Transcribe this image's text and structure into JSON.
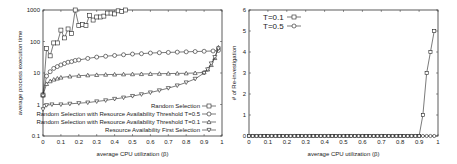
{
  "chart_data": [
    {
      "type": "line",
      "title": "",
      "xlabel": "average CPU utilization (β)",
      "ylabel": "average process execution time",
      "xlim": [
        0,
        1
      ],
      "ylim": [
        0.1,
        1000
      ],
      "yscale": "log",
      "grid": false,
      "legend_position": "lower right",
      "x_ticks": [
        "0",
        "0.1",
        "0.2",
        "0.3",
        "0.4",
        "0.5",
        "0.6",
        "0.7",
        "0.8",
        "0.9",
        "1"
      ],
      "y_ticks": [
        "0.1",
        "1",
        "10",
        "100",
        "1000"
      ],
      "series": [
        {
          "name": "Random Selection",
          "marker": "square",
          "x": [
            0,
            0.02,
            0.04,
            0.06,
            0.08,
            0.1,
            0.12,
            0.14,
            0.16,
            0.18,
            0.2,
            0.22,
            0.24,
            0.26,
            0.28,
            0.3,
            0.32,
            0.34,
            0.36,
            0.38,
            0.4,
            0.42,
            0.44,
            0.46
          ],
          "values": [
            2,
            60,
            35,
            90,
            90,
            230,
            130,
            250,
            180,
            1000,
            320,
            350,
            320,
            680,
            480,
            600,
            600,
            640,
            800,
            800,
            750,
            940,
            890,
            1000
          ]
        },
        {
          "name": "Random Selection with Resource Availability Threshold T=0.5",
          "marker": "circle",
          "x": [
            0,
            0.02,
            0.04,
            0.06,
            0.08,
            0.1,
            0.12,
            0.14,
            0.16,
            0.18,
            0.2,
            0.25,
            0.3,
            0.35,
            0.4,
            0.45,
            0.5,
            0.55,
            0.6,
            0.65,
            0.7,
            0.75,
            0.8,
            0.85,
            0.9,
            0.95,
            0.98
          ],
          "values": [
            2,
            8,
            11,
            14,
            16,
            18,
            20,
            22,
            23,
            25,
            26,
            29,
            32,
            34,
            36,
            38,
            40,
            41,
            43,
            44,
            45,
            46,
            47,
            48,
            49,
            50,
            52
          ]
        },
        {
          "name": "Random Selection with Resource Availability Threshold T=0.1",
          "marker": "triangle-up",
          "x": [
            0,
            0.02,
            0.04,
            0.06,
            0.08,
            0.1,
            0.15,
            0.2,
            0.25,
            0.3,
            0.35,
            0.4,
            0.45,
            0.5,
            0.55,
            0.6,
            0.65,
            0.7,
            0.75,
            0.8,
            0.85,
            0.9,
            0.92,
            0.94,
            0.96,
            0.98
          ],
          "values": [
            2,
            4.5,
            5.5,
            6.2,
            6.7,
            7.2,
            7.8,
            8.2,
            8.5,
            8.7,
            8.9,
            9,
            9.1,
            9.2,
            9.3,
            9.4,
            9.5,
            9.6,
            9.7,
            9.8,
            10,
            10.5,
            13,
            18,
            30,
            65
          ]
        },
        {
          "name": "Resource Availability First Selection",
          "marker": "triangle-down",
          "x": [
            0,
            0.02,
            0.05,
            0.1,
            0.15,
            0.2,
            0.25,
            0.3,
            0.35,
            0.4,
            0.45,
            0.5,
            0.55,
            0.6,
            0.65,
            0.7,
            0.75,
            0.8,
            0.85,
            0.9,
            0.92,
            0.94,
            0.96,
            0.98
          ],
          "values": [
            0.7,
            0.95,
            1.0,
            1.0,
            1.05,
            1.1,
            1.15,
            1.25,
            1.35,
            1.5,
            1.65,
            1.85,
            2.1,
            2.4,
            2.8,
            3.3,
            4,
            5,
            6.5,
            10,
            13,
            20,
            32,
            60
          ]
        }
      ]
    },
    {
      "type": "line",
      "title": "",
      "xlabel": "average CPU utilization (β)",
      "ylabel": "# of Re-investigation",
      "xlim": [
        0,
        1
      ],
      "ylim": [
        0,
        6
      ],
      "grid": false,
      "legend_position": "upper left",
      "x_ticks": [
        "0",
        "0.1",
        "0.2",
        "0.3",
        "0.4",
        "0.5",
        "0.6",
        "0.7",
        "0.8",
        "0.9",
        "1"
      ],
      "y_ticks": [
        "0",
        "1",
        "2",
        "3",
        "4",
        "5",
        "6"
      ],
      "series": [
        {
          "name": "T=0.1",
          "marker": "square",
          "x": [
            0,
            0.02,
            0.04,
            0.06,
            0.08,
            0.1,
            0.12,
            0.14,
            0.16,
            0.18,
            0.2,
            0.22,
            0.24,
            0.26,
            0.28,
            0.3,
            0.32,
            0.34,
            0.36,
            0.38,
            0.4,
            0.42,
            0.44,
            0.46,
            0.48,
            0.5,
            0.52,
            0.54,
            0.56,
            0.58,
            0.6,
            0.62,
            0.64,
            0.66,
            0.68,
            0.7,
            0.72,
            0.74,
            0.76,
            0.78,
            0.8,
            0.82,
            0.84,
            0.86,
            0.88,
            0.9,
            0.92,
            0.94,
            0.96,
            0.98
          ],
          "values": [
            0,
            0,
            0,
            0,
            0,
            0,
            0,
            0,
            0,
            0,
            0,
            0,
            0,
            0,
            0,
            0,
            0,
            0,
            0,
            0,
            0,
            0,
            0,
            0,
            0,
            0,
            0,
            0,
            0,
            0,
            0,
            0,
            0,
            0,
            0,
            0,
            0,
            0,
            0,
            0,
            0,
            0,
            0,
            0,
            0,
            0,
            1,
            3,
            4,
            5
          ]
        },
        {
          "name": "T=0.5",
          "marker": "circle",
          "x": [
            0,
            0.02,
            0.04,
            0.06,
            0.08,
            0.1,
            0.12,
            0.14,
            0.16,
            0.18,
            0.2,
            0.22,
            0.24,
            0.26,
            0.28,
            0.3,
            0.32,
            0.34,
            0.36,
            0.38,
            0.4,
            0.42,
            0.44,
            0.46,
            0.48,
            0.5,
            0.52,
            0.54,
            0.56,
            0.58,
            0.6,
            0.62,
            0.64,
            0.66,
            0.68,
            0.7,
            0.72,
            0.74,
            0.76,
            0.78,
            0.8,
            0.82,
            0.84,
            0.86,
            0.88,
            0.9,
            0.92,
            0.94,
            0.96,
            0.98
          ],
          "values": [
            0,
            0,
            0,
            0,
            0,
            0,
            0,
            0,
            0,
            0,
            0,
            0,
            0,
            0,
            0,
            0,
            0,
            0,
            0,
            0,
            0,
            0,
            0,
            0,
            0,
            0,
            0,
            0,
            0,
            0,
            0,
            0,
            0,
            0,
            0,
            0,
            0,
            0,
            0,
            0,
            0,
            0,
            0,
            0,
            0,
            0,
            0,
            0,
            0,
            0
          ]
        }
      ]
    }
  ]
}
